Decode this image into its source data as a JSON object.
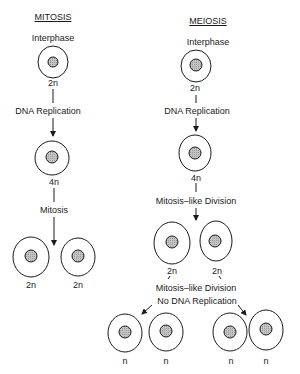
{
  "mitosis": {
    "title": "MITOSIS",
    "stage1": "Interphase",
    "ploidy1": "2n",
    "step1": "DNA Replication",
    "ploidy2": "4n",
    "step2": "Mitosis",
    "daughters": [
      "2n",
      "2n"
    ]
  },
  "meiosis": {
    "title": "MEIOSIS",
    "stage1": "Interphase",
    "ploidy1": "2n",
    "step1": "DNA Replication",
    "ploidy2": "4n",
    "step2": "Mitosis–like Division",
    "intermediates": [
      "2n",
      "2n"
    ],
    "step3_line1": "Mitosis–like Division",
    "step3_line2": "No DNA Replication",
    "gametes": [
      "n",
      "n",
      "n",
      "n"
    ]
  },
  "colors": {
    "line": "#1a1a1a",
    "nucleus_fill": "#bdbdbd"
  }
}
